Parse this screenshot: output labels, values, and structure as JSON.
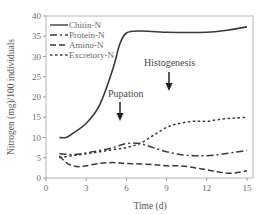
{
  "chart_data": {
    "type": "line",
    "title": "",
    "xlabel": "Time (d)",
    "ylabel": "Nitrogen (mg)/100 individuals",
    "xlim": [
      0,
      15
    ],
    "ylim": [
      0,
      40
    ],
    "xticks": [
      0,
      3,
      6,
      9,
      12,
      15
    ],
    "yticks": [
      0,
      5,
      10,
      15,
      20,
      25,
      30,
      35,
      40
    ],
    "grid": false,
    "legend_position": "upper left",
    "series": [
      {
        "name": "Chitin-N",
        "style": "solid",
        "x": [
          1,
          1.5,
          2,
          3,
          4,
          5,
          5.5,
          6,
          7,
          9,
          12,
          13.5,
          15
        ],
        "values": [
          10,
          10,
          11,
          13.5,
          18,
          27,
          33,
          35.8,
          36.3,
          36,
          36,
          36.5,
          37.3
        ]
      },
      {
        "name": "Protein-N",
        "style": "dash-dot",
        "x": [
          1,
          2,
          3,
          4,
          5,
          6,
          7,
          8,
          9,
          10,
          11,
          12,
          13,
          14,
          15
        ],
        "values": [
          6,
          5.8,
          6.2,
          6.8,
          7.5,
          8.5,
          8.5,
          7.5,
          6.5,
          5.8,
          5.5,
          5.5,
          5.8,
          6.3,
          6.8
        ]
      },
      {
        "name": "Amino-N",
        "style": "dashed",
        "x": [
          1,
          1.5,
          2,
          2.5,
          3,
          4,
          5,
          6,
          8,
          9,
          10,
          11,
          12,
          13,
          14,
          15
        ],
        "values": [
          5.5,
          3.8,
          3,
          2.8,
          3,
          3.6,
          3.8,
          3.6,
          3.3,
          3,
          3,
          2.6,
          2,
          1.4,
          1.2,
          1.8
        ]
      },
      {
        "name": "Excretory-N",
        "style": "dotted",
        "x": [
          1,
          2,
          3,
          4,
          5,
          6,
          7,
          8,
          9,
          10,
          11,
          12,
          13,
          14,
          15
        ],
        "values": [
          5,
          5.5,
          6,
          6.5,
          7,
          7.5,
          8.5,
          10.5,
          12.5,
          13.5,
          14,
          14,
          14.5,
          14.8,
          15
        ]
      }
    ],
    "annotations": [
      {
        "text": "Pupation",
        "x": 5.6,
        "arrow_to_y": 20
      },
      {
        "text": "Histogenesis",
        "x": 9.3,
        "arrow_to_y": 25.5
      }
    ]
  },
  "labels": {
    "xlabel": "Time (d)",
    "ylabel": "Nitrogen (mg)/100 individuals",
    "xticks": [
      "0",
      "3",
      "6",
      "9",
      "12",
      "15"
    ],
    "yticks": [
      "0",
      "5",
      "10",
      "15",
      "20",
      "25",
      "30",
      "35",
      "40"
    ],
    "legend": [
      "Chitin-N",
      "Protein-N",
      "Amino-N",
      "Excretory-N"
    ],
    "pupation": "Pupation",
    "histogenesis": "Histogenesis"
  },
  "colors": {
    "line": "#3a3a3a",
    "axis": "#9a9a9a",
    "text": "#6a6a6a"
  }
}
